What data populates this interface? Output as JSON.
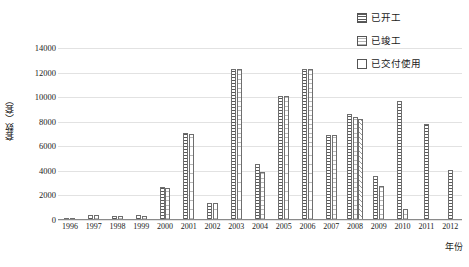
{
  "chart_data": {
    "type": "bar",
    "title": "",
    "xlabel": "年份",
    "ylabel": "套数（套）",
    "ylim": [
      0,
      14000
    ],
    "ytick_step": 2000,
    "yticks": [
      "14000",
      "12000",
      "10000",
      "8000",
      "6000",
      "4000",
      "2000",
      "0"
    ],
    "grid": true,
    "legend_position": "top-right",
    "categories": [
      "1996",
      "1997",
      "1998",
      "1999",
      "2000",
      "2001",
      "2002",
      "2003",
      "2004",
      "2005",
      "2006",
      "2007",
      "2008",
      "2009",
      "2010",
      "2011",
      "2012"
    ],
    "series": [
      {
        "name": "已开工",
        "pattern": "horizontal-lines",
        "values": [
          120,
          430,
          330,
          380,
          2700,
          7050,
          1380,
          12300,
          4600,
          10100,
          12300,
          6900,
          8600,
          3600,
          9700,
          7800,
          4100
        ]
      },
      {
        "name": "已竣工",
        "pattern": "fine-grid-dots",
        "values": [
          110,
          420,
          320,
          360,
          2600,
          7000,
          1350,
          12300,
          3900,
          10100,
          12300,
          6900,
          8400,
          2800,
          900,
          null,
          null
        ]
      },
      {
        "name": "已交付使用",
        "pattern": "diagonal-hatch",
        "values": [
          null,
          null,
          null,
          null,
          null,
          null,
          null,
          null,
          null,
          null,
          null,
          null,
          8200,
          null,
          null,
          null,
          null
        ]
      }
    ]
  },
  "legend": {
    "items": [
      {
        "label": "已开工",
        "swatch": "pattern-horizontal-lines"
      },
      {
        "label": "已竣工",
        "swatch": "pattern-fine-grid"
      },
      {
        "label": "已交付使用",
        "swatch": "pattern-diagonal"
      }
    ]
  }
}
